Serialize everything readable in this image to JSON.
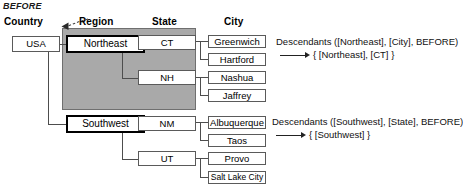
{
  "diagram": {
    "title": "BEFORE",
    "columns": [
      {
        "label": "Country"
      },
      {
        "label": "Region"
      },
      {
        "label": "State"
      },
      {
        "label": "City"
      }
    ],
    "country": {
      "label": "USA"
    },
    "regions": [
      {
        "label": "Northeast",
        "highlighted": true
      },
      {
        "label": "Southwest",
        "highlighted": true
      }
    ],
    "states": [
      {
        "label": "CT"
      },
      {
        "label": "NH"
      },
      {
        "label": "NM"
      },
      {
        "label": "UT"
      }
    ],
    "cities": [
      {
        "label": "Greenwich"
      },
      {
        "label": "Hartford"
      },
      {
        "label": "Nashua"
      },
      {
        "label": "Jaffrey"
      },
      {
        "label": "Albuquerque"
      },
      {
        "label": "Taos"
      },
      {
        "label": "Provo"
      },
      {
        "label": "Salt Lake City"
      }
    ],
    "annotations": [
      {
        "call": "Descendants ([Northeast], [City], BEFORE)",
        "result": "{ [Northeast], [CT] }"
      },
      {
        "call": "Descendants ([Southwest], [State], BEFORE)",
        "result": "{ [Southwest] }"
      }
    ],
    "colors": {
      "selection_fill": "#a9a9a9",
      "selection_border": "#6f6f6f",
      "box_border": "#5a5a5a",
      "highlight_border": "#000000",
      "line": "#4d4d4d",
      "text": "#111111"
    }
  }
}
